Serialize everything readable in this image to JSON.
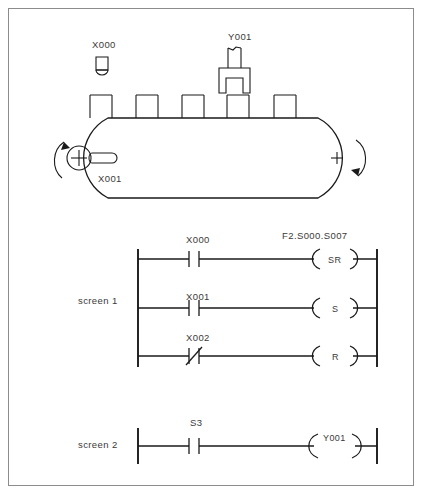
{
  "figure": {
    "border_color": "#8c8c8c",
    "line_color": "#1a1a1a",
    "text_color": "#3a3a3a",
    "background": "#ffffff"
  },
  "machine": {
    "sensor": {
      "label": "X000",
      "type": "photo-sensor"
    },
    "actuator": {
      "label": "Y001",
      "type": "gripper"
    },
    "encoder": {
      "label": "X001",
      "type": "rotary-hub"
    },
    "drive_pulley_mark": "+",
    "idler_pulley_mark": "+",
    "rotation_direction": "clockwise",
    "part_count": 5
  },
  "ladder": {
    "screens": [
      {
        "name": "screen 1",
        "rungs": [
          {
            "contact": "X000",
            "contact_type": "NO",
            "coil": "SR",
            "coil_label": "F2.S000.S007"
          },
          {
            "contact": "X001",
            "contact_type": "NO",
            "coil": "S",
            "coil_label": ""
          },
          {
            "contact": "X002",
            "contact_type": "NC",
            "coil": "R",
            "coil_label": ""
          }
        ]
      },
      {
        "name": "screen 2",
        "rungs": [
          {
            "contact": "S3",
            "contact_type": "NO",
            "coil": "Y001",
            "coil_label": ""
          }
        ]
      }
    ]
  }
}
